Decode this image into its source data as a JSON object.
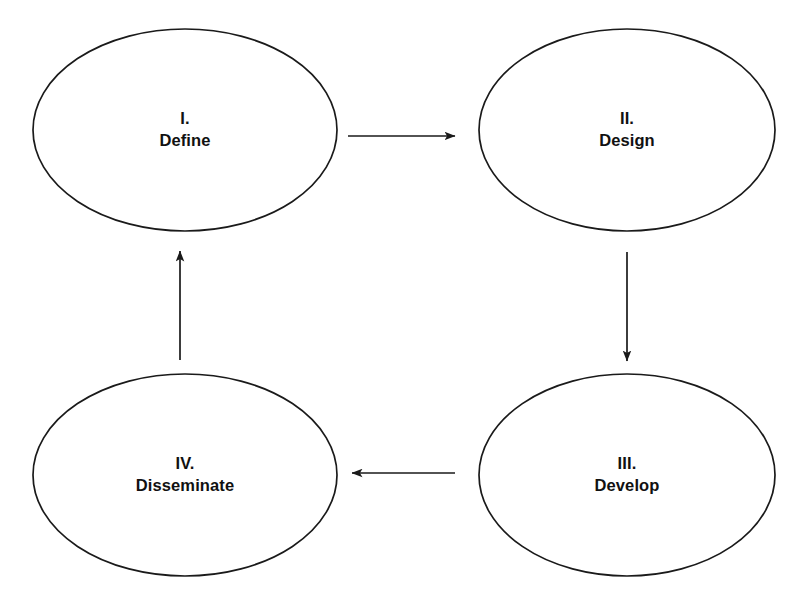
{
  "diagram": {
    "type": "cycle-flowchart",
    "background_color": "#ffffff",
    "stroke_color": "#1a1a1a",
    "text_color": "#111111",
    "nodes": [
      {
        "id": "define",
        "numeral": "I.",
        "name": "Define",
        "shape": "ellipse",
        "cx": 185,
        "cy": 130,
        "rx": 152,
        "ry": 101
      },
      {
        "id": "design",
        "numeral": "II.",
        "name": "Design",
        "shape": "ellipse",
        "cx": 627,
        "cy": 130,
        "rx": 148,
        "ry": 101
      },
      {
        "id": "develop",
        "numeral": "III.",
        "name": "Develop",
        "shape": "ellipse",
        "cx": 627,
        "cy": 475,
        "rx": 148,
        "ry": 101
      },
      {
        "id": "disseminate",
        "numeral": "IV.",
        "name": "Disseminate",
        "shape": "ellipse",
        "cx": 185,
        "cy": 475,
        "rx": 152,
        "ry": 101
      }
    ],
    "connectors": [
      {
        "id": "define-to-design",
        "from": "define",
        "to": "design",
        "direction": "right",
        "x1": 348,
        "y1": 136,
        "x2": 455,
        "y2": 136
      },
      {
        "id": "design-to-develop",
        "from": "design",
        "to": "develop",
        "direction": "down",
        "x1": 627,
        "y1": 252,
        "x2": 627,
        "y2": 361
      },
      {
        "id": "develop-to-disseminate",
        "from": "develop",
        "to": "disseminate",
        "direction": "left",
        "x1": 455,
        "y1": 473,
        "x2": 352,
        "y2": 473
      },
      {
        "id": "disseminate-to-define",
        "from": "disseminate",
        "to": "define",
        "direction": "up",
        "x1": 180,
        "y1": 360,
        "x2": 180,
        "y2": 251
      }
    ]
  }
}
